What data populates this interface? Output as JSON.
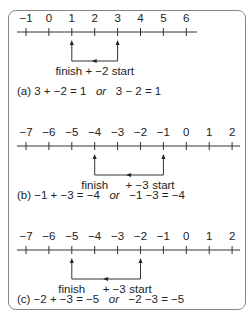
{
  "panels": [
    {
      "id": "a",
      "ticks": [
        "−1",
        "0",
        "1",
        "2",
        "3",
        "4",
        "5",
        "6"
      ],
      "start_index": 4,
      "finish_index": 2,
      "labels": {
        "finish": "finish",
        "op": "+ −2",
        "start": "start",
        "combined": "finish + −2 start"
      },
      "equation": {
        "prefix": "(a) 3 + −2 = 1",
        "or": "or",
        "alt": "3 − 2 = 1"
      }
    },
    {
      "id": "b",
      "ticks": [
        "−7",
        "−6",
        "−5",
        "−4",
        "−3",
        "−2",
        "−1",
        "0",
        "1",
        "2"
      ],
      "start_index": 6,
      "finish_index": 3,
      "labels": {
        "finish": "finish",
        "op": "+ −3",
        "start": "start"
      },
      "equation": {
        "prefix": "(b) −1 + −3 = −4",
        "or": "or",
        "alt": "−1 −3 = −4"
      }
    },
    {
      "id": "c",
      "ticks": [
        "−7",
        "−6",
        "−5",
        "−4",
        "−3",
        "−2",
        "−1",
        "0",
        "1",
        "2"
      ],
      "start_index": 5,
      "finish_index": 2,
      "labels": {
        "finish": "finish",
        "op": "+ −3",
        "start": "start"
      },
      "equation": {
        "prefix": "(c) −2 + −3 = −5",
        "or": "or",
        "alt": "−2 −3 = −5"
      }
    }
  ]
}
